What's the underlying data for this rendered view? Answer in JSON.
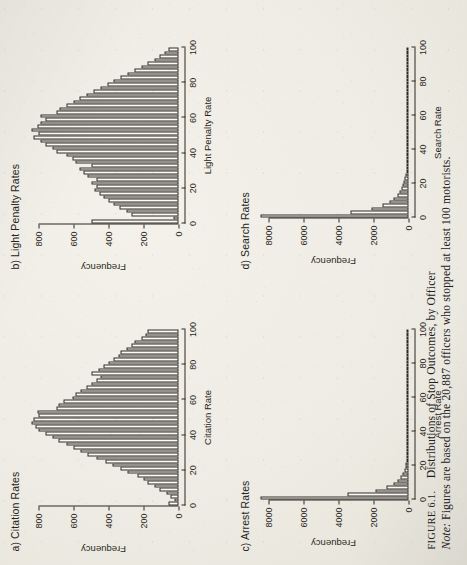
{
  "page": {
    "background_color": "#eeece4",
    "ink_color": "#2b2822",
    "bar_fill_color": "#fbfaf6",
    "rotation_degrees": -90
  },
  "caption": {
    "figure_label": "FIGURE 6.1.",
    "title": "Distributions of Stop Outcomes, by Officer",
    "note_label": "Note:",
    "note_text": "Figures are based on the 20,887 officers who stopped at least 100 motorists."
  },
  "panels": [
    {
      "key": "a",
      "title": "a) Citation Rates",
      "xlabel": "Citation Rate",
      "ylabel": "Frequency",
      "xticks": [
        0,
        20,
        40,
        60,
        80,
        100
      ],
      "yticks": [
        0,
        200,
        400,
        600,
        800
      ],
      "xlim": [
        0,
        100
      ],
      "ylim": [
        0,
        860
      ]
    },
    {
      "key": "b",
      "title": "b) Light Penalty Rates",
      "xlabel": "Light Penalty Rate",
      "ylabel": "Frequency",
      "xticks": [
        0,
        20,
        40,
        60,
        80,
        100
      ],
      "yticks": [
        0,
        200,
        400,
        600,
        800
      ],
      "xlim": [
        0,
        100
      ],
      "ylim": [
        0,
        860
      ]
    },
    {
      "key": "c",
      "title": "c) Arrest Rates",
      "xlabel": "Arrest Rate",
      "ylabel": "Frequency",
      "xticks": [
        0,
        20,
        40,
        60,
        80,
        100
      ],
      "yticks": [
        0,
        2000,
        4000,
        6000,
        8000
      ],
      "xlim": [
        0,
        100
      ],
      "ylim": [
        0,
        8600
      ]
    },
    {
      "key": "d",
      "title": "d) Search Rates",
      "xlabel": "Search Rate",
      "ylabel": "Frequency",
      "xticks": [
        0,
        20,
        40,
        60,
        80,
        100
      ],
      "yticks": [
        0,
        2000,
        4000,
        6000,
        8000
      ],
      "xlim": [
        0,
        100
      ],
      "ylim": [
        0,
        8600
      ]
    }
  ],
  "chart_data": [
    {
      "type": "bar",
      "id": "a",
      "title": "a) Citation Rates",
      "xlabel": "Citation Rate",
      "ylabel": "Frequency",
      "xlim": [
        0,
        100
      ],
      "ylim": [
        0,
        860
      ],
      "grid": false,
      "legend": "none",
      "bin_width": 2,
      "bin_starts": [
        0,
        2,
        4,
        6,
        8,
        10,
        12,
        14,
        16,
        18,
        20,
        22,
        24,
        26,
        28,
        30,
        32,
        34,
        36,
        38,
        40,
        42,
        44,
        46,
        48,
        50,
        52,
        54,
        56,
        58,
        60,
        62,
        64,
        66,
        68,
        70,
        72,
        74,
        76,
        78,
        80,
        82,
        84,
        86,
        88,
        90,
        92,
        94,
        96,
        98
      ],
      "values": [
        60,
        25,
        45,
        70,
        110,
        140,
        175,
        200,
        235,
        290,
        330,
        380,
        420,
        470,
        520,
        560,
        600,
        640,
        690,
        720,
        760,
        800,
        820,
        845,
        830,
        800,
        810,
        700,
        690,
        660,
        610,
        590,
        560,
        530,
        500,
        470,
        450,
        500,
        460,
        430,
        400,
        370,
        345,
        330,
        300,
        270,
        250,
        215,
        190,
        175
      ]
    },
    {
      "type": "bar",
      "id": "b",
      "title": "b) Light Penalty Rates",
      "xlabel": "Light Penalty Rate",
      "ylabel": "Frequency",
      "xlim": [
        0,
        100
      ],
      "ylim": [
        0,
        860
      ],
      "grid": false,
      "legend": "none",
      "bin_width": 2,
      "bin_starts": [
        0,
        2,
        4,
        6,
        8,
        10,
        12,
        14,
        16,
        18,
        20,
        22,
        24,
        26,
        28,
        30,
        32,
        34,
        36,
        38,
        40,
        42,
        44,
        46,
        48,
        50,
        52,
        54,
        56,
        58,
        60,
        62,
        64,
        66,
        68,
        70,
        72,
        74,
        76,
        78,
        80,
        82,
        84,
        86,
        88,
        90,
        92,
        94,
        96,
        98
      ],
      "values": [
        500,
        30,
        270,
        300,
        340,
        375,
        400,
        430,
        455,
        480,
        470,
        500,
        470,
        520,
        545,
        565,
        500,
        590,
        610,
        640,
        700,
        720,
        760,
        790,
        830,
        800,
        845,
        810,
        790,
        760,
        790,
        700,
        680,
        640,
        600,
        570,
        530,
        490,
        450,
        410,
        370,
        330,
        290,
        250,
        210,
        175,
        140,
        110,
        80,
        55
      ]
    },
    {
      "type": "bar",
      "id": "c",
      "title": "c) Arrest Rates",
      "xlabel": "Arrest Rate",
      "ylabel": "Frequency",
      "xlim": [
        0,
        100
      ],
      "ylim": [
        0,
        8600
      ],
      "grid": false,
      "legend": "none",
      "bin_width": 2,
      "bin_starts": [
        0,
        2,
        4,
        6,
        8,
        10,
        12,
        14,
        16,
        18,
        20,
        22,
        24,
        26,
        28,
        30,
        32,
        34,
        36,
        38,
        40,
        42,
        44,
        46,
        48,
        50,
        52,
        54,
        56,
        58,
        60,
        62,
        64,
        66,
        68,
        70,
        72,
        74,
        76,
        78,
        80,
        82,
        84,
        86,
        88,
        90,
        92,
        94,
        96,
        98
      ],
      "values": [
        8500,
        3500,
        1900,
        1250,
        850,
        620,
        440,
        330,
        250,
        190,
        145,
        115,
        90,
        70,
        55,
        45,
        36,
        30,
        24,
        20,
        16,
        13,
        11,
        9,
        8,
        7,
        6,
        5,
        4,
        4,
        3,
        3,
        2,
        2,
        2,
        2,
        1,
        1,
        1,
        1,
        1,
        1,
        1,
        1,
        1,
        0,
        0,
        0,
        0,
        1
      ]
    },
    {
      "type": "bar",
      "id": "d",
      "title": "d) Search Rates",
      "xlabel": "Search Rate",
      "ylabel": "Frequency",
      "xlim": [
        0,
        100
      ],
      "ylim": [
        0,
        8600
      ],
      "grid": false,
      "legend": "none",
      "bin_width": 2,
      "bin_starts": [
        0,
        2,
        4,
        6,
        8,
        10,
        12,
        14,
        16,
        18,
        20,
        22,
        24,
        26,
        28,
        30,
        32,
        34,
        36,
        38,
        40,
        42,
        44,
        46,
        48,
        50,
        52,
        54,
        56,
        58,
        60,
        62,
        64,
        66,
        68,
        70,
        72,
        74,
        76,
        78,
        80,
        82,
        84,
        86,
        88,
        90,
        92,
        94,
        96,
        98
      ],
      "values": [
        8500,
        3300,
        2100,
        1500,
        1100,
        850,
        660,
        520,
        410,
        330,
        260,
        210,
        170,
        135,
        110,
        90,
        72,
        58,
        47,
        38,
        31,
        25,
        20,
        17,
        14,
        11,
        9,
        8,
        6,
        5,
        4,
        4,
        3,
        3,
        2,
        2,
        2,
        1,
        1,
        1,
        1,
        1,
        1,
        1,
        1,
        0,
        0,
        0,
        0,
        1
      ]
    }
  ]
}
